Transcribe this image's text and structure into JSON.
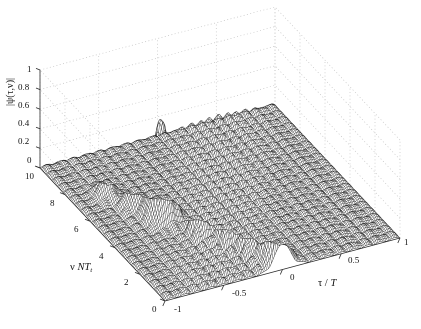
{
  "figure": {
    "kind": "3d-mesh-surface-plot",
    "background": "#ffffff",
    "mesh_color": "#1c1c1c",
    "grid_color": "#b9b9b9",
    "axis_color": "#2b2b2b"
  },
  "axes": {
    "x": {
      "label_parts": {
        "var": "τ",
        "slash": " / ",
        "den": "T"
      },
      "label": "τ / T",
      "ticks": [
        "-1",
        "-0.5",
        "0",
        "0.5",
        "1"
      ],
      "tick_values": [
        -1,
        -0.5,
        0,
        0.5,
        1
      ],
      "range": [
        -1,
        1
      ]
    },
    "y": {
      "label_parts": {
        "nu": "ν",
        "N": "N",
        "T": "T",
        "sub": "t"
      },
      "label": "ν NT t",
      "ticks": [
        "0",
        "2",
        "4",
        "6",
        "8",
        "10"
      ],
      "tick_values": [
        0,
        2,
        4,
        6,
        8,
        10
      ],
      "range": [
        0,
        10
      ]
    },
    "z": {
      "label": "|ψ(τ,ν)|",
      "ticks": [
        "0",
        "0.2",
        "0.4",
        "0.6",
        "0.8",
        "1"
      ],
      "tick_values": [
        0,
        0.2,
        0.4,
        0.6,
        0.8,
        1
      ],
      "range": [
        0,
        1
      ]
    }
  },
  "chart_data": {
    "type": "surface",
    "title": "",
    "xlabel": "τ / T",
    "ylabel": "ν NT_t",
    "zlabel": "|ψ(τ,ν)|",
    "xlim": [
      -1,
      1
    ],
    "ylim": [
      0,
      10
    ],
    "zlim": [
      0,
      1
    ],
    "grid": true,
    "legend": null,
    "peaks": [
      {
        "name": "main-peak",
        "tau_over_T": -0.5,
        "nu_NTt": 5.0,
        "height": 1.0,
        "half_width_tau": 0.09,
        "half_width_nu": 0.55
      },
      {
        "name": "secondary-peak",
        "tau_over_T": 0.0,
        "nu_NTt": 0.6,
        "height": 0.94,
        "half_width_tau": 0.085,
        "half_width_nu": 0.5
      },
      {
        "name": "ridge-peak-a",
        "tau_over_T": -0.34,
        "nu_NTt": 3.4,
        "height": 0.38,
        "half_width_tau": 0.07,
        "half_width_nu": 0.45
      },
      {
        "name": "ridge-peak-b",
        "tau_over_T": -0.22,
        "nu_NTt": 2.4,
        "height": 0.3,
        "half_width_tau": 0.07,
        "half_width_nu": 0.45
      },
      {
        "name": "ridge-peak-c",
        "tau_over_T": -0.12,
        "nu_NTt": 1.5,
        "height": 0.24,
        "half_width_tau": 0.07,
        "half_width_nu": 0.45
      },
      {
        "name": "ridge-peak-d",
        "tau_over_T": -0.62,
        "nu_NTt": 6.1,
        "height": 0.3,
        "half_width_tau": 0.07,
        "half_width_nu": 0.45
      },
      {
        "name": "ridge-peak-e",
        "tau_over_T": -0.74,
        "nu_NTt": 7.2,
        "height": 0.22,
        "half_width_tau": 0.07,
        "half_width_nu": 0.45
      }
    ],
    "sidelobe_model": {
      "pedestal_amplitude": 0.055,
      "tau_oscillation_cycles": 26,
      "nu_oscillation_cycles": 22
    },
    "grid_steps": {
      "nx": 150,
      "ny": 110
    }
  },
  "axis_geometry": {
    "origin_xy": [
      40,
      168
    ],
    "corner_front": [
      165,
      301
    ],
    "corner_right": [
      400,
      238
    ],
    "corner_back": [
      272,
      106
    ],
    "z_top": [
      40,
      70
    ]
  }
}
